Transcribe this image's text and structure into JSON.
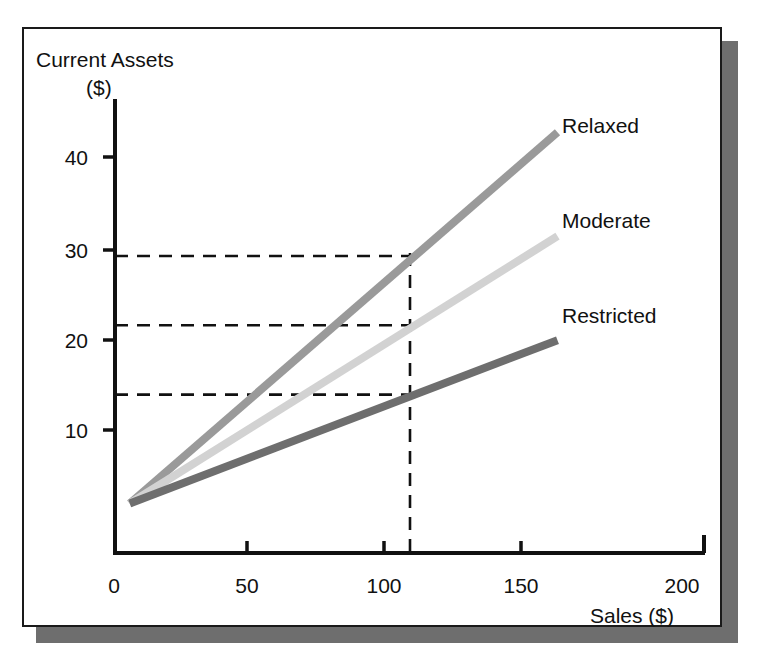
{
  "figure": {
    "background": "#ffffff",
    "frame_border_color": "#1a1a1a",
    "shadow_color": "#6e6e6e"
  },
  "chart_data": {
    "type": "line",
    "title": "",
    "xlabel": "Sales ($)",
    "ylabel": "Current Assets ($)",
    "ylabel_line1": "Current Assets",
    "ylabel_line2": "($)",
    "xlim": [
      0,
      200
    ],
    "ylim": [
      0,
      45
    ],
    "xticks": [
      0,
      50,
      100,
      150,
      200
    ],
    "xtick_labels": [
      "0",
      "50",
      "100",
      "150",
      "200"
    ],
    "yticks": [
      10,
      20,
      30,
      40
    ],
    "ytick_labels": [
      "10",
      "20",
      "30",
      "40"
    ],
    "grid": false,
    "legend": "inline-right-of-line-end",
    "x": [
      5,
      150
    ],
    "series": [
      {
        "name": "Relaxed",
        "label": "Relaxed",
        "color": "#9a9a9a",
        "values": [
          5,
          42.5
        ],
        "value_at_100": 30
      },
      {
        "name": "Moderate",
        "label": "Moderate",
        "color": "#d2d2d2",
        "values": [
          5,
          32
        ],
        "value_at_100": 23
      },
      {
        "name": "Restricted",
        "label": "Restricted",
        "color": "#6e6e6e",
        "values": [
          5,
          21.5
        ],
        "value_at_100": 16
      }
    ],
    "annotations": {
      "guide_x": 100,
      "guide_ys": [
        30,
        23,
        16
      ],
      "guide_style": "dashed",
      "guide_color": "#111111"
    }
  }
}
